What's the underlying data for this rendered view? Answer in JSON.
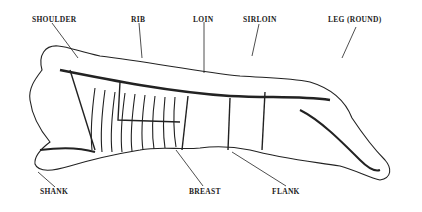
{
  "diagram": {
    "labels": {
      "shoulder": "SHOULDER",
      "rib": "RIB",
      "loin": "LOIN",
      "sirloin": "SIRLOIN",
      "leg": "LEG (ROUND)",
      "shank": "SHANK",
      "breast": "BREAST",
      "flank": "FLANK"
    }
  }
}
